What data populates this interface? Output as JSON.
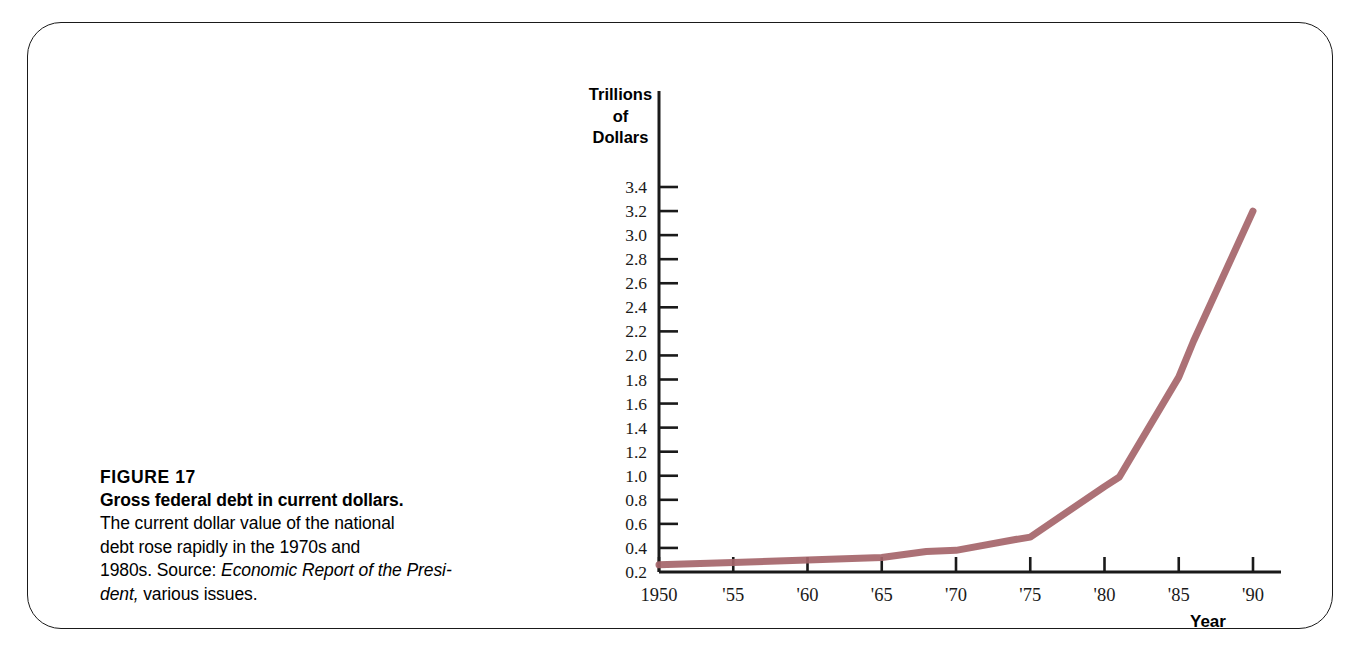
{
  "figure": {
    "number_label": "FIGURE 17",
    "title": "Gross federal debt in current dollars.",
    "body_line1": "The current dollar value of the national",
    "body_line2": "debt rose rapidly in the 1970s and",
    "body_line3_prefix": "1980s.  Source: ",
    "source_title": "Economic Report of the Presi-",
    "source_title_cont": "dent,",
    "body_line4_suffix": " various issues."
  },
  "chart_data": {
    "type": "line",
    "title": "Gross federal debt in current dollars",
    "xlabel": "Year",
    "ylabel": "Trillions of Dollars",
    "ylabel_lines": [
      "Trillions",
      "of",
      "Dollars"
    ],
    "xlim": [
      1950,
      1990
    ],
    "ylim": [
      0.2,
      3.4
    ],
    "grid": false,
    "legend": null,
    "line_color": "#a5656a",
    "axis_color": "#1a1a1a",
    "ytick_labels": [
      "3.4",
      "3.2",
      "3.0",
      "2.8",
      "2.6",
      "2.4",
      "2.2",
      "2.0",
      "1.8",
      "1.6",
      "1.4",
      "1.2",
      "1.0",
      "0.8",
      "0.6",
      "0.4",
      "0.2"
    ],
    "ytick_values": [
      3.4,
      3.2,
      3.0,
      2.8,
      2.6,
      2.4,
      2.2,
      2.0,
      1.8,
      1.6,
      1.4,
      1.2,
      1.0,
      0.8,
      0.6,
      0.4,
      0.2
    ],
    "xtick_labels": [
      "1950",
      "'55",
      "'60",
      "'65",
      "'70",
      "'75",
      "'80",
      "'85",
      "'90"
    ],
    "xtick_values": [
      1950,
      1955,
      1960,
      1965,
      1970,
      1975,
      1980,
      1985,
      1990
    ],
    "x": [
      1950,
      1955,
      1960,
      1965,
      1968,
      1970,
      1974,
      1975,
      1980,
      1981,
      1985,
      1986,
      1990
    ],
    "values": [
      0.26,
      0.28,
      0.3,
      0.32,
      0.37,
      0.38,
      0.47,
      0.49,
      0.91,
      0.99,
      1.82,
      2.12,
      3.2
    ],
    "series_name": "Gross federal debt"
  }
}
